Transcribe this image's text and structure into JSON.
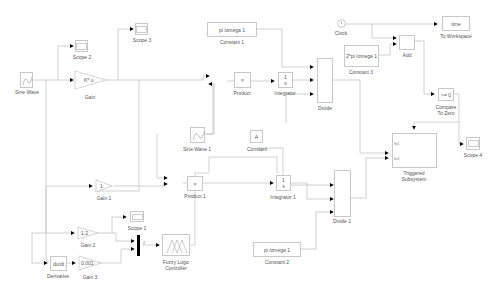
{
  "diagram": {
    "type": "simulink-model",
    "line_color": "#c0c0c0",
    "arrow_color": "#000000",
    "blocks": [
      {
        "id": "sine_wave",
        "label": "Sine Wave",
        "type": "source"
      },
      {
        "id": "scope2",
        "label": "Scope 2",
        "type": "scope"
      },
      {
        "id": "scope3",
        "label": "Scope 3",
        "type": "scope"
      },
      {
        "id": "gain",
        "label": "Gain",
        "text": "K* u",
        "type": "gain"
      },
      {
        "id": "constant1",
        "label": "Constant 1",
        "text": "pi /omega 1",
        "type": "constant"
      },
      {
        "id": "product",
        "label": "Product",
        "text": "×",
        "type": "product"
      },
      {
        "id": "integrator",
        "label": "Integrator",
        "text_num": "1",
        "text_den": "s",
        "type": "integrator"
      },
      {
        "id": "divide",
        "label": "Divide",
        "type": "divide"
      },
      {
        "id": "clock",
        "label": "Clock",
        "type": "clock"
      },
      {
        "id": "to_workspace",
        "label": "To Workspace",
        "text": "time",
        "type": "sink"
      },
      {
        "id": "constant3",
        "label": "Constant 3",
        "text": "2*pi /omega 1",
        "type": "constant"
      },
      {
        "id": "add",
        "label": "Add",
        "type": "sum"
      },
      {
        "id": "compare_zero",
        "label": "Compare\nTo Zero",
        "label_line1": "Compare",
        "label_line2": "To Zero",
        "text": ">= 0",
        "type": "compare"
      },
      {
        "id": "scope4",
        "label": "Scope 4",
        "type": "scope"
      },
      {
        "id": "sine_wave1",
        "label": "Sine Wave 1",
        "type": "source"
      },
      {
        "id": "constant",
        "label": "Constant",
        "text": "A",
        "type": "constant"
      },
      {
        "id": "triggered_subsystem",
        "label": "Triggered\nSubsystem",
        "label_line1": "Triggered",
        "label_line2": "Subsystem",
        "in1": "In1",
        "in2": "In2",
        "type": "subsystem"
      },
      {
        "id": "gain1",
        "label": "Gain 1",
        "text": "1",
        "type": "gain"
      },
      {
        "id": "product1",
        "label": "Product 1",
        "text": "×",
        "type": "product"
      },
      {
        "id": "integrator1",
        "label": "Integrator 1",
        "text_num": "1",
        "text_den": "s",
        "type": "integrator"
      },
      {
        "id": "divide1",
        "label": "Divide 1",
        "type": "divide"
      },
      {
        "id": "scope1",
        "label": "Scope 1",
        "type": "scope"
      },
      {
        "id": "gain2",
        "label": "Gain 2",
        "text": "1.2",
        "type": "gain"
      },
      {
        "id": "mux",
        "label": "",
        "port_label": "2",
        "type": "mux"
      },
      {
        "id": "fuzzy",
        "label": "Fuzzy Logic\nController",
        "label_line1": "Fuzzy Logic",
        "label_line2": "Controller",
        "type": "fuzzy"
      },
      {
        "id": "derivative",
        "label": "Derivative",
        "text": "du/dt",
        "type": "derivative"
      },
      {
        "id": "gain3",
        "label": "Gain 3",
        "text": "0.001",
        "type": "gain"
      },
      {
        "id": "constant2",
        "label": "Constant 2",
        "text": "pi /omega 1",
        "type": "constant"
      }
    ]
  },
  "labels": {
    "sine_wave": "Sine Wave",
    "scope2": "Scope 2",
    "scope3": "Scope 3",
    "gain": "Gain",
    "gain_text": "K* u",
    "constant1": "Constant 1",
    "constant1_text": "pi /omega 1",
    "product": "Product",
    "integrator": "Integrator",
    "int_num": "1",
    "int_den": "s",
    "divide": "Divide",
    "clock": "Clock",
    "to_workspace": "To Workspace",
    "to_workspace_text": "time",
    "constant3": "Constant 3",
    "constant3_text": "2*pi /omega 1",
    "add": "Add",
    "compare1": "Compare",
    "compare2": "To Zero",
    "compare_text": ">= 0",
    "scope4": "Scope 4",
    "sine_wave1": "Sine Wave 1",
    "constant": "Constant",
    "constant_text": "A",
    "trig1": "Triggered",
    "trig2": "Subsystem",
    "in1": "In1",
    "in2": "In2",
    "gain1": "Gain 1",
    "gain1_text": "1",
    "product1": "Product 1",
    "integrator1": "Integrator 1",
    "divide1": "Divide 1",
    "scope1": "Scope 1",
    "gain2": "Gain 2",
    "gain2_text": "1.2",
    "mux_port": "2",
    "fuzzy1": "Fuzzy Logic",
    "fuzzy2": "Controller",
    "derivative": "Derivative",
    "derivative_text": "du/dt",
    "gain3": "Gain 3",
    "gain3_text": "0.001",
    "constant2": "Constant 2",
    "constant2_text": "pi /omega 1"
  }
}
